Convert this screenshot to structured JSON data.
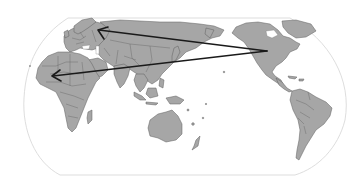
{
  "map": {
    "type": "world-map",
    "projection": "pseudo-cylindrical (Robinson-like), Pacific-centered",
    "background_color": "#ffffff",
    "land_color": "#a6a6a6",
    "border_color": "#5e5e5e",
    "outline_color": "#d9d9d9",
    "arrow_color": "#1a1a1a",
    "regions_visible": [
      "Europe",
      "Africa",
      "Asia",
      "Australia",
      "North America",
      "South America",
      "Oceania"
    ],
    "arrows": [
      {
        "id": "arrow-1",
        "from": "North America (western USA/Canada)",
        "to": "Northern Europe / Western Russia",
        "from_px": [
          267,
          51
        ],
        "to_px": [
          98,
          30
        ]
      },
      {
        "id": "arrow-2",
        "from": "North America (western USA/Canada)",
        "to": "Northeast Africa / Red Sea region",
        "from_px": [
          267,
          51
        ],
        "to_px": [
          52,
          76
        ]
      }
    ]
  }
}
